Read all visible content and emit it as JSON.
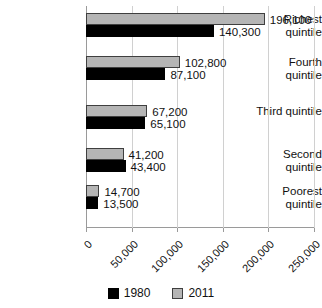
{
  "chart_data": {
    "type": "bar",
    "orientation": "horizontal",
    "title": "",
    "xlabel": "",
    "ylabel": "",
    "xlim": [
      0,
      250000
    ],
    "grid": true,
    "legend_position": "bottom-center",
    "categories": [
      "Richest\nquintile",
      "Fourth\nquintile",
      "Third quintile",
      "Second\nquintile",
      "Poorest\nquintile"
    ],
    "xticks": [
      0,
      50000,
      100000,
      150000,
      200000,
      250000
    ],
    "xtick_labels": [
      "0",
      "50,000",
      "100,000",
      "150,000",
      "200,000",
      "250,000"
    ],
    "series": [
      {
        "name": "2011",
        "color": "#b5b5b5",
        "values": [
          196100,
          102800,
          67200,
          41200,
          14700
        ],
        "value_labels": [
          "196,100",
          "102,800",
          "67,200",
          "41,200",
          "14,700"
        ]
      },
      {
        "name": "1980",
        "color": "#000000",
        "values": [
          140300,
          87100,
          65100,
          43400,
          13500
        ],
        "value_labels": [
          "140,300",
          "87,100",
          "65,100",
          "43,400",
          "13,500"
        ]
      }
    ]
  },
  "legend": {
    "items": [
      {
        "label": "1980",
        "color": "#000000"
      },
      {
        "label": "2011",
        "color": "#b5b5b5"
      }
    ]
  }
}
